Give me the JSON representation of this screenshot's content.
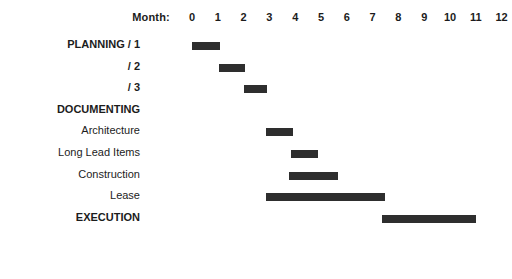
{
  "chart_data": {
    "type": "bar",
    "title": "",
    "subtitle": "",
    "xlabel": "Month:",
    "ylabel": "",
    "orientation": "horizontal",
    "style": "gantt",
    "grid": false,
    "legend": "none",
    "bar_color": "#2e2e2e",
    "axis": {
      "label": "Month:",
      "ticks": [
        "0",
        "1",
        "2",
        "3",
        "4",
        "5",
        "6",
        "7",
        "8",
        "9",
        "10",
        "11",
        "12"
      ],
      "tick_values": [
        0,
        1,
        2,
        3,
        4,
        5,
        6,
        7,
        8,
        9,
        10,
        11,
        12
      ],
      "xlim": [
        0,
        12
      ],
      "origin_px": 192,
      "px_per_month": 25.8
    },
    "categories": [
      "PLANNING / 1",
      "/ 2",
      "/ 3",
      "DOCUMENTING",
      "Architecture",
      "Long Lead Items",
      "Construction",
      "Lease",
      "EXECUTION"
    ],
    "tasks": [
      {
        "label": "PLANNING / 1",
        "bold": true,
        "start": 0.0,
        "end": 1.1,
        "has_bar": true
      },
      {
        "label": "/ 2",
        "bold": true,
        "start": 1.05,
        "end": 2.05,
        "has_bar": true
      },
      {
        "label": "/ 3",
        "bold": true,
        "start": 2.0,
        "end": 2.9,
        "has_bar": true
      },
      {
        "label": "DOCUMENTING",
        "bold": true,
        "start": 0,
        "end": 0,
        "has_bar": false
      },
      {
        "label": "Architecture",
        "bold": false,
        "start": 2.85,
        "end": 3.9,
        "has_bar": true
      },
      {
        "label": "Long Lead Items",
        "bold": false,
        "start": 3.85,
        "end": 4.9,
        "has_bar": true
      },
      {
        "label": "Construction",
        "bold": false,
        "start": 3.75,
        "end": 5.65,
        "has_bar": true
      },
      {
        "label": "Lease",
        "bold": false,
        "start": 2.85,
        "end": 7.5,
        "has_bar": true
      },
      {
        "label": "EXECUTION",
        "bold": true,
        "start": 7.35,
        "end": 11.0,
        "has_bar": true
      }
    ]
  }
}
